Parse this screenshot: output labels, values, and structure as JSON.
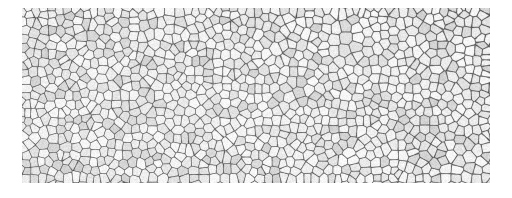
{
  "page": {
    "background_color": "#ffffff",
    "width": 512,
    "height": 198
  },
  "figure": {
    "kind": "micrograph",
    "caption": "",
    "frame": {
      "x": 22,
      "y": 8,
      "width": 468,
      "height": 175
    },
    "colors": {
      "page": "#ffffff",
      "cell_fill_light": "#f4f4f4",
      "cell_fill_mid": "#e6e6e6",
      "cell_fill_dark": "#d8d8d8",
      "boundary": "#6e6e6e",
      "boundary_dark": "#4f4f4f",
      "matrix": "#b9b9b9"
    },
    "texture": {
      "render": "voronoi-cells",
      "seed": 20240517,
      "cell_count": 1180,
      "mean_cell_diameter_px": 13,
      "min_cell_diameter_px": 4,
      "max_cell_diameter_px": 26,
      "boundary_width_px": 1.6,
      "relaxation_iterations": 3,
      "grain_noise_opacity": 0.16,
      "size_gradient": "slightly coarser toward upper-right, finer toward lower-left"
    }
  }
}
